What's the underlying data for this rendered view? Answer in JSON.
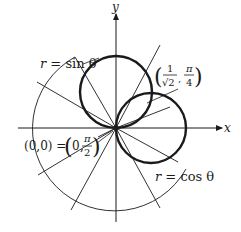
{
  "figure": {
    "axes": {
      "x_label": "x",
      "y_label": "y"
    },
    "curves": [
      {
        "name": "sine-circle",
        "label": "r = sin θ",
        "equation_lhs": "r",
        "equation_rhs": "sin θ"
      },
      {
        "name": "cosine-circle",
        "label": "r = cos θ",
        "equation_lhs": "r",
        "equation_rhs": "cos θ"
      }
    ],
    "annotations": {
      "intersection_point": {
        "text": "(1/√2, π/4)",
        "num": "1",
        "den": "√2",
        "angle_num": "π",
        "angle_den": "4"
      },
      "origin_point": {
        "text": "(0,0) = (0, π/2)",
        "prefix": "(0,0) =",
        "r": "0",
        "angle_num": "π",
        "angle_den": "2"
      }
    },
    "colors": {
      "ink": "#1a1a1a",
      "background": "#ffffff"
    }
  }
}
